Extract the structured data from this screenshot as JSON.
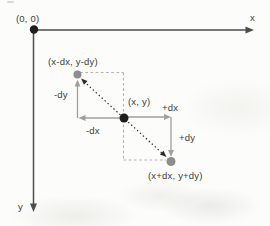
{
  "diagram": {
    "axes": {
      "x": "x",
      "y": "y"
    },
    "points": {
      "origin": {
        "label": "(0, 0)"
      },
      "center": {
        "label": "(x, y)"
      },
      "top_left": {
        "label": "(x-dx, y-dy)"
      },
      "bottom_right": {
        "label": "(x+dx, y+dy)"
      }
    },
    "offset_labels": {
      "minus_dx": "-dx",
      "minus_dy": "-dy",
      "plus_dx": "+dx",
      "plus_dy": "+dy"
    },
    "colors": {
      "axis": "#4d4d4d",
      "point_black": "#1e1e1e",
      "point_gray": "#8d8d8d",
      "arrow_gray": "#9f9f9f",
      "dashed_gray": "#b5b5b5",
      "dotted_black": "#2b2b2b",
      "text": "#404040",
      "background": "#fcfcfa"
    }
  }
}
